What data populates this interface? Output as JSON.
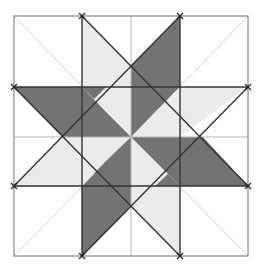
{
  "diagram": {
    "colors": {
      "background": "#ffffff",
      "dark_fill": "#737373",
      "light_fill": "#ebebeb",
      "grid_line": "#b0b0b0",
      "guide_line": "#d4d4d4",
      "edge_line": "#333333",
      "outer_border": "#808080"
    },
    "grid": {
      "x": [
        14,
        82,
        131,
        180,
        248
      ],
      "y": [
        16,
        87,
        137,
        186,
        256
      ]
    },
    "markers": [
      {
        "x": 82,
        "y": 16
      },
      {
        "x": 180,
        "y": 16
      },
      {
        "x": 248,
        "y": 87
      },
      {
        "x": 248,
        "y": 186
      },
      {
        "x": 180,
        "y": 256
      },
      {
        "x": 82,
        "y": 256
      },
      {
        "x": 14,
        "y": 186
      },
      {
        "x": 14,
        "y": 87
      }
    ]
  }
}
